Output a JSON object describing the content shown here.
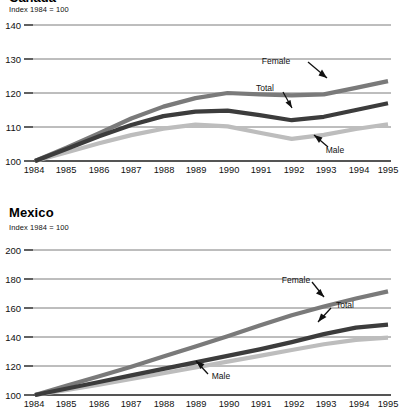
{
  "figures": [
    {
      "id": "top",
      "title": "Canada",
      "title_clipped": true,
      "subtitle": "Index 1984 = 100",
      "annotations": [
        {
          "label": "Female"
        },
        {
          "label": "Total"
        },
        {
          "label": "Male"
        }
      ],
      "chart_data": {
        "type": "line",
        "title": "Canada",
        "subtitle": "Index 1984 = 100",
        "xlabel": "",
        "ylabel": "Index 1984 = 100",
        "x": [
          1984,
          1985,
          1986,
          1987,
          1988,
          1989,
          1990,
          1991,
          1992,
          1993,
          1994,
          1995
        ],
        "xtick_labels": [
          "1984",
          "1985",
          "1986",
          "1987",
          "1988",
          "1989",
          "1990",
          "1991",
          "1992",
          "1993",
          "1994",
          "1995"
        ],
        "ylim": [
          100,
          140
        ],
        "yticks": [
          100,
          110,
          120,
          130,
          140
        ],
        "ytick_labels": [
          "100",
          "110",
          "120",
          "130",
          "140"
        ],
        "grid": true,
        "legend": "annotated-inline",
        "series": [
          {
            "name": "Female",
            "color": "#7a7a7a",
            "values": [
              100.0,
              104.0,
              108.2,
              112.5,
              116.0,
              118.5,
              120.0,
              119.6,
              119.3,
              119.6,
              121.5,
              123.5
            ]
          },
          {
            "name": "Total",
            "color": "#3c3c3c",
            "values": [
              100.0,
              103.6,
              107.3,
              110.6,
              113.2,
              114.5,
              114.8,
              113.5,
              112.0,
              113.0,
              115.0,
              117.0
            ]
          },
          {
            "name": "Male",
            "color": "#bdbdbd",
            "values": [
              100.0,
              102.6,
              105.2,
              107.6,
              109.5,
              110.7,
              110.2,
              108.3,
              106.5,
              107.7,
              109.4,
              110.8
            ]
          }
        ]
      }
    },
    {
      "id": "bottom",
      "title": "Mexico",
      "title_clipped": false,
      "subtitle": "Index 1984 = 100",
      "annotations": [
        {
          "label": "Female"
        },
        {
          "label": "Total"
        },
        {
          "label": "Male"
        }
      ],
      "chart_data": {
        "type": "line",
        "title": "Mexico",
        "subtitle": "Index 1984 = 100",
        "xlabel": "",
        "ylabel": "Index 1984 = 100",
        "x": [
          1984,
          1985,
          1986,
          1987,
          1988,
          1989,
          1990,
          1991,
          1992,
          1993,
          1994,
          1995
        ],
        "xtick_labels": [
          "1984",
          "1985",
          "1986",
          "1987",
          "1988",
          "1989",
          "1990",
          "1991",
          "1992",
          "1993",
          "1994",
          "1995"
        ],
        "ylim": [
          100,
          200
        ],
        "yticks": [
          100,
          120,
          140,
          160,
          180,
          200
        ],
        "ytick_labels": [
          "100",
          "120",
          "140",
          "160",
          "180",
          "200"
        ],
        "grid": true,
        "legend": "annotated-inline",
        "series": [
          {
            "name": "Female",
            "color": "#7a7a7a",
            "values": [
              100.0,
              106.5,
              113.0,
              119.5,
              126.5,
              133.5,
              140.5,
              148.0,
              155.0,
              161.0,
              166.5,
              171.5
            ]
          },
          {
            "name": "Total",
            "color": "#3c3c3c",
            "values": [
              100.0,
              104.5,
              109.0,
              113.5,
              118.0,
              122.5,
              127.0,
              131.5,
              136.5,
              142.0,
              146.5,
              148.5
            ]
          },
          {
            "name": "Male",
            "color": "#bdbdbd",
            "values": [
              100.0,
              103.5,
              107.2,
              111.0,
              115.0,
              119.0,
              123.0,
              127.0,
              131.0,
              135.0,
              138.0,
              139.5
            ]
          }
        ]
      }
    }
  ]
}
